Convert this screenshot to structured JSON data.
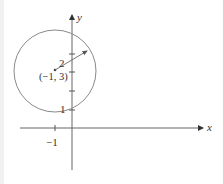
{
  "diagram": {
    "type": "circle-on-coordinate-plane",
    "axes": {
      "x_label": "x",
      "y_label": "y",
      "x_tick_labels": [
        "−1"
      ],
      "y_tick_labels": [
        "1"
      ]
    },
    "circle": {
      "center_label": "(−1, 3)",
      "center": [
        -1,
        3
      ],
      "radius": 2,
      "radius_label": "2"
    },
    "colors": {
      "axis": "#555555",
      "circle": "#888888",
      "text": "#333333"
    }
  }
}
